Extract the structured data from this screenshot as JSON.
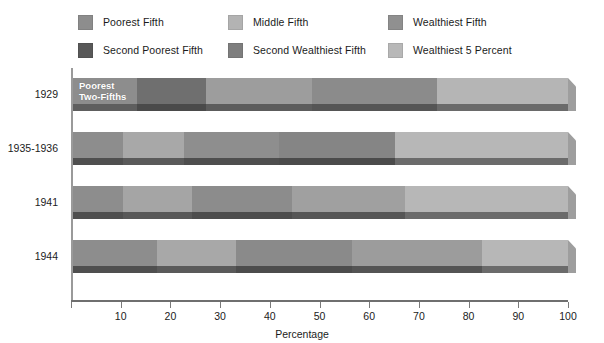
{
  "legend": {
    "items": [
      {
        "label": "Poorest Fifth",
        "color": "#8d8d8d",
        "key": "poorest_fifth"
      },
      {
        "label": "Second Poorest Fifth",
        "color": "#585858",
        "key": "second_poorest_fifth"
      },
      {
        "label": "Middle Fifth",
        "color": "#b3b3b3",
        "key": "middle_fifth"
      },
      {
        "label": "Second Wealthiest Fifth",
        "color": "#7e7e7e",
        "key": "second_wealthiest_fifth"
      },
      {
        "label": "Wealthiest Fifth",
        "color": "#909090",
        "key": "wealthiest_fifth"
      },
      {
        "label": "Wealthiest 5 Percent",
        "color": "#b8b8b8",
        "key": "wealthiest_5_percent"
      }
    ]
  },
  "axis": {
    "title": "Percentage",
    "ticks": [
      0,
      10,
      20,
      30,
      40,
      50,
      60,
      70,
      80,
      90,
      100
    ],
    "tick_labels": [
      "",
      "10",
      "20",
      "30",
      "40",
      "50",
      "60",
      "70",
      "80",
      "90",
      "100"
    ],
    "min": 0,
    "max": 100
  },
  "annotation": {
    "poorest_two_fifths": "Poorest\nTwo-Fifths"
  },
  "chart_data": {
    "type": "bar",
    "orientation": "horizontal",
    "stacked": true,
    "title": "",
    "xlabel": "Percentage",
    "ylabel": "",
    "xlim": [
      0,
      100
    ],
    "grid": false,
    "legend_position": "top",
    "categories": [
      "1929",
      "1935-1936",
      "1941",
      "1944"
    ],
    "series": [
      {
        "name": "Poorest Fifth",
        "color": "#8d8d8d",
        "values": [
          13.0,
          10.2,
          10.2,
          17.0
        ]
      },
      {
        "name": "Second Poorest Fifth",
        "color": "#585858",
        "values": [
          13.8,
          12.2,
          13.8,
          16.0
        ]
      },
      {
        "name": "Middle Fifth",
        "color": "#b3b3b3",
        "values": [
          21.5,
          19.2,
          20.3,
          23.3
        ]
      },
      {
        "name": "Second Wealthiest Fifth",
        "color": "#7e7e7e",
        "values": [
          25.3,
          23.4,
          22.7,
          26.4
        ]
      },
      {
        "name": "Wealthiest Fifth",
        "color": "#909090",
        "values": [
          26.4,
          35.0,
          33.0,
          17.3
        ]
      }
    ],
    "bar_boundaries_percent": {
      "1929": [
        13.0,
        26.8,
        48.3,
        73.6,
        100.0
      ],
      "1935-1936": [
        10.2,
        22.4,
        41.6,
        65.0,
        100.0
      ],
      "1941": [
        10.2,
        24.0,
        44.3,
        67.0,
        100.0
      ],
      "1944": [
        17.0,
        33.0,
        56.3,
        82.7,
        100.0
      ]
    },
    "annotations": [
      {
        "text": "Poorest Two-Fifths",
        "category": "1929",
        "at_percent": 0
      }
    ]
  },
  "rows": [
    {
      "label": "1929",
      "segments": [
        {
          "key": "poorest_fifth",
          "color": "#8d8d8d",
          "shadow": "#5e5e5e",
          "width": 13.0
        },
        {
          "key": "second_poorest_fifth",
          "color": "#6f6f6f",
          "shadow": "#4a4a4a",
          "width": 13.8
        },
        {
          "key": "middle_fifth",
          "color": "#9d9d9d",
          "shadow": "#5c5c5c",
          "width": 21.5
        },
        {
          "key": "second_wealthiest_fifth",
          "color": "#8b8b8b",
          "shadow": "#555555",
          "width": 25.3
        },
        {
          "key": "wealthiest_fifth",
          "color": "#b5b5b5",
          "shadow": "#6a6a6a",
          "width": 26.4
        }
      ],
      "note": "Poorest\nTwo-Fifths"
    },
    {
      "label": "1935-1936",
      "segments": [
        {
          "key": "poorest_fifth",
          "color": "#8d8d8d",
          "shadow": "#4f4f4f",
          "width": 10.2
        },
        {
          "key": "second_poorest_fifth",
          "color": "#a8a8a8",
          "shadow": "#5a5a5a",
          "width": 12.2
        },
        {
          "key": "middle_fifth",
          "color": "#8e8e8e",
          "shadow": "#4e4e4e",
          "width": 19.2
        },
        {
          "key": "second_wealthiest_fifth",
          "color": "#858585",
          "shadow": "#4b4b4b",
          "width": 23.4
        },
        {
          "key": "wealthiest_fifth",
          "color": "#b7b7b7",
          "shadow": "#6b6b6b",
          "width": 35.0
        }
      ],
      "note": ""
    },
    {
      "label": "1941",
      "segments": [
        {
          "key": "poorest_fifth",
          "color": "#8d8d8d",
          "shadow": "#4f4f4f",
          "width": 10.2
        },
        {
          "key": "second_poorest_fifth",
          "color": "#a5a5a5",
          "shadow": "#585858",
          "width": 13.8
        },
        {
          "key": "middle_fifth",
          "color": "#8c8c8c",
          "shadow": "#4d4d4d",
          "width": 20.3
        },
        {
          "key": "second_wealthiest_fifth",
          "color": "#a0a0a0",
          "shadow": "#565656",
          "width": 22.7
        },
        {
          "key": "wealthiest_fifth",
          "color": "#b7b7b7",
          "shadow": "#6b6b6b",
          "width": 33.0
        }
      ],
      "note": ""
    },
    {
      "label": "1944",
      "segments": [
        {
          "key": "poorest_fifth",
          "color": "#8d8d8d",
          "shadow": "#4f4f4f",
          "width": 17.0
        },
        {
          "key": "second_poorest_fifth",
          "color": "#a8a8a8",
          "shadow": "#5a5a5a",
          "width": 16.0
        },
        {
          "key": "middle_fifth",
          "color": "#8a8a8a",
          "shadow": "#4c4c4c",
          "width": 23.3
        },
        {
          "key": "second_wealthiest_fifth",
          "color": "#9c9c9c",
          "shadow": "#545454",
          "width": 26.4
        },
        {
          "key": "wealthiest_fifth",
          "color": "#b7b7b7",
          "shadow": "#6b6b6b",
          "width": 17.3
        }
      ],
      "note": ""
    }
  ]
}
